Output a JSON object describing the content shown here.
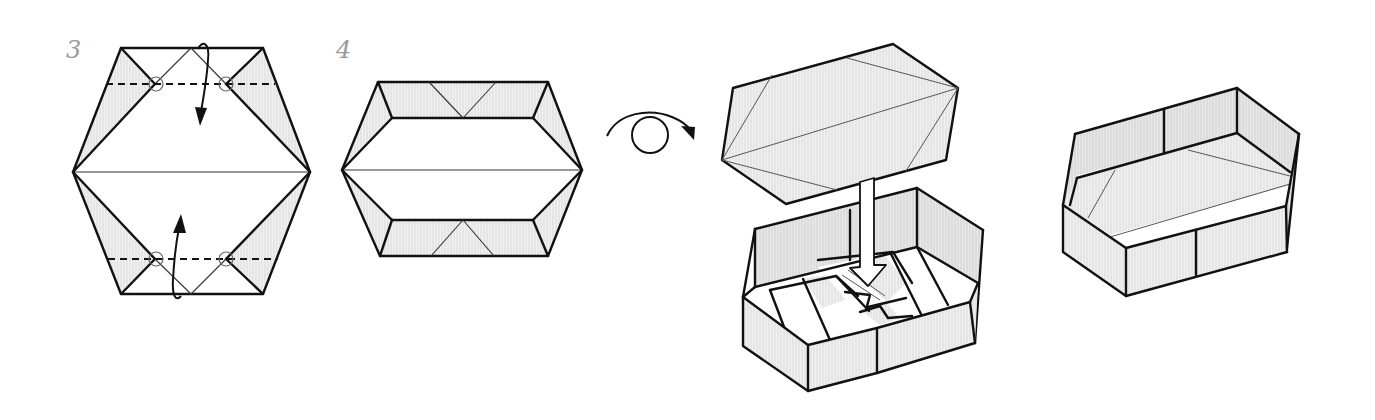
{
  "diagram": {
    "type": "origami instructions",
    "steps": [
      {
        "number": "3",
        "description": "Hexagonal base with valley folds (dashed lines) at top and bottom; pinch points marked with circles; curved arrows indicate folding the top edge down and the bottom edge up."
      },
      {
        "number": "4",
        "description": "Result after folding: hexagon with top and bottom flaps folded inward, showing small triangular creases at the center of each flap."
      }
    ],
    "symbols": {
      "turn_over": "turn-over-symbol (circle with curved arrow)",
      "valley_fold": "dashed line",
      "pinch_mark": "small circle",
      "fold_arrow": "curved arrow with filled head",
      "insert_arrow": "hollow downward arrow"
    },
    "final_views": [
      {
        "label": "",
        "description": "Lid (hexagonal) being inserted into the box base — hollow arrow pointing down into the box."
      },
      {
        "label": "",
        "description": "Completed hexagonal box."
      }
    ],
    "colors": {
      "line": "#111111",
      "shade": "#e6e6e6",
      "step_number": "#9a9a9a",
      "background": "#ffffff"
    }
  }
}
